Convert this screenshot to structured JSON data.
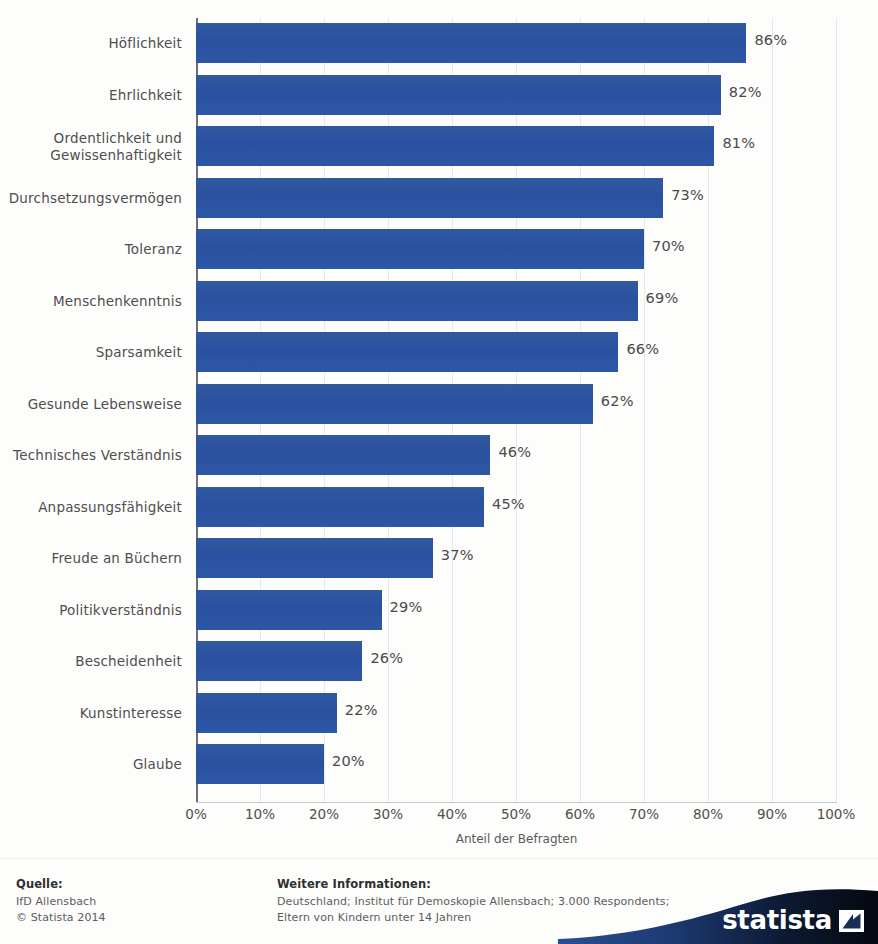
{
  "chart_data": {
    "type": "bar",
    "orientation": "horizontal",
    "title": "",
    "xlabel": "Anteil der Befragten",
    "ylabel": "",
    "xlim": [
      0,
      100
    ],
    "xticks": [
      "0%",
      "10%",
      "20%",
      "30%",
      "40%",
      "50%",
      "60%",
      "70%",
      "80%",
      "90%",
      "100%"
    ],
    "xtick_values": [
      0,
      10,
      20,
      30,
      40,
      50,
      60,
      70,
      80,
      90,
      100
    ],
    "grid": true,
    "legend": false,
    "bar_color": "#2d57a5",
    "categories": [
      "Höflichkeit",
      "Ehrlichkeit",
      "Ordentlichkeit und Gewissenhaftigkeit",
      "Durchsetzungsvermögen",
      "Toleranz",
      "Menschenkenntnis",
      "Sparsamkeit",
      "Gesunde Lebensweise",
      "Technisches Verständnis",
      "Anpassungsfähigkeit",
      "Freude an Büchern",
      "Politikverständnis",
      "Bescheidenheit",
      "Kunstinteresse",
      "Glaube"
    ],
    "values": [
      86,
      82,
      81,
      73,
      70,
      69,
      66,
      62,
      46,
      45,
      37,
      29,
      26,
      22,
      20
    ],
    "value_labels": [
      "86%",
      "82%",
      "81%",
      "73%",
      "70%",
      "69%",
      "66%",
      "62%",
      "46%",
      "45%",
      "37%",
      "29%",
      "26%",
      "22%",
      "20%"
    ]
  },
  "footer": {
    "source_heading": "Quelle:",
    "source_lines": [
      "IfD Allensbach",
      "© Statista 2014"
    ],
    "more_heading": "Weitere Informationen:",
    "more_lines": [
      "Deutschland; Institut für Demoskopie Allensbach; 3.000 Respondents;",
      "Eltern von Kindern unter 14 Jahren"
    ],
    "logo_text": "statista"
  }
}
